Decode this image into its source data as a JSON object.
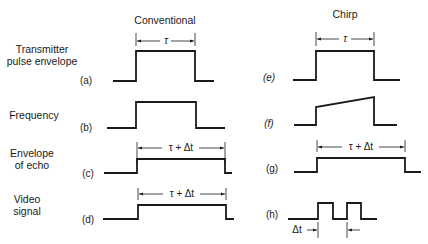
{
  "columns": {
    "conventional": "Conventional",
    "chirp": "Chirp"
  },
  "row_labels": [
    [
      "Transmitter",
      "pulse envelope"
    ],
    [
      "Frequency"
    ],
    [
      "Envelope",
      "of echo"
    ],
    [
      "Video",
      "signal"
    ]
  ],
  "panels": [
    {
      "tag": "(a)",
      "column": "conventional",
      "kind": "rect-pulse",
      "dimension": "τ"
    },
    {
      "tag": "(b)",
      "column": "conventional",
      "kind": "rect-pulse",
      "dimension": ""
    },
    {
      "tag": "(c)",
      "column": "conventional",
      "kind": "rect-pulse",
      "dimension": "τ + Δt"
    },
    {
      "tag": "(d)",
      "column": "conventional",
      "kind": "rect-pulse",
      "dimension": "τ + Δt"
    },
    {
      "tag": "(e)",
      "column": "chirp",
      "kind": "rect-pulse",
      "dimension": "τ"
    },
    {
      "tag": "(f)",
      "column": "chirp",
      "kind": "ramp-pulse",
      "dimension": ""
    },
    {
      "tag": "(g)",
      "column": "chirp",
      "kind": "rect-pulse",
      "dimension": "τ + Δt"
    },
    {
      "tag": "(h)",
      "column": "chirp",
      "kind": "double-pulse",
      "dimension": "Δt"
    }
  ]
}
